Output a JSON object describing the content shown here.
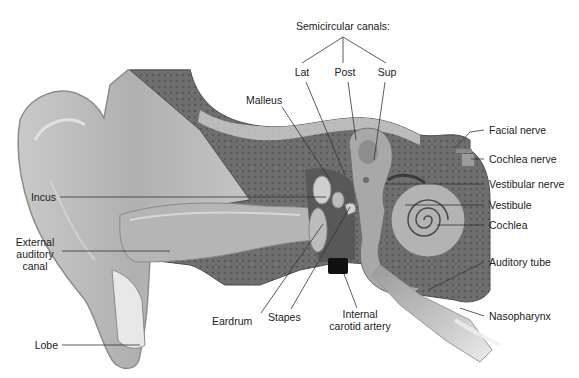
{
  "diagram": {
    "title": "Semicircular canals:",
    "semicircular_canals": {
      "heading": "Semicircular canals:",
      "branches": [
        {
          "id": "lat",
          "label": "Lat"
        },
        {
          "id": "post",
          "label": "Post"
        },
        {
          "id": "sup",
          "label": "Sup"
        }
      ]
    },
    "labels_left": [
      {
        "id": "incus",
        "label": "Incus"
      },
      {
        "id": "external-auditory-canal",
        "label_lines": [
          "External",
          "auditory",
          "canal"
        ]
      },
      {
        "id": "lobe",
        "label": "Lobe"
      }
    ],
    "labels_top": [
      {
        "id": "malleus",
        "label": "Malleus"
      }
    ],
    "labels_right": [
      {
        "id": "facial-nerve",
        "label": "Facial nerve"
      },
      {
        "id": "cochlea-nerve",
        "label": "Cochlea nerve"
      },
      {
        "id": "vestibular-nerve",
        "label": "Vestibular nerve"
      },
      {
        "id": "vestibule",
        "label": "Vestibule"
      },
      {
        "id": "cochlea",
        "label": "Cochlea"
      },
      {
        "id": "auditory-tube",
        "label": "Auditory tube"
      },
      {
        "id": "nasopharynx",
        "label": "Nasopharynx"
      }
    ],
    "labels_bottom": [
      {
        "id": "eardrum",
        "label": "Eardrum"
      },
      {
        "id": "stapes",
        "label": "Stapes"
      },
      {
        "id": "internal-carotid-artery",
        "label_lines": [
          "Internal",
          "carotid artery"
        ]
      }
    ],
    "colors": {
      "skin": "#b9b9b9",
      "skin_light": "#d6d6d6",
      "bone": "#7a7a7a",
      "bone_dark": "#5e5e5e",
      "leader_line": "#333333",
      "text": "#222222",
      "artery": "#111111"
    }
  }
}
